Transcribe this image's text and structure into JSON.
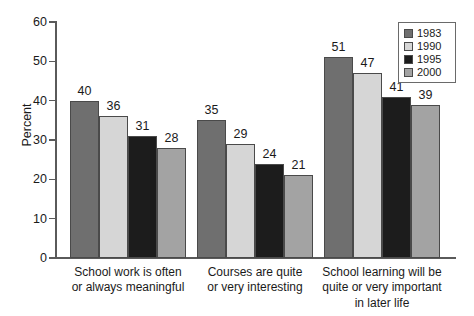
{
  "chart_data": {
    "type": "bar",
    "title": "",
    "xlabel": "",
    "ylabel": "Percent",
    "ylim": [
      0,
      60
    ],
    "ytick_labels": [
      "60",
      "50",
      "40",
      "30",
      "20",
      "10",
      "0"
    ],
    "yticks": [
      60,
      50,
      40,
      30,
      20,
      10,
      0
    ],
    "grid": false,
    "legend_position": "top-right",
    "categories": [
      "School work is often\nor always meaningful",
      "Courses are quite\nor very interesting",
      "School learning will be\nquite or very important\nin later life"
    ],
    "series": [
      {
        "name": "1983",
        "color": "#6f6f6f",
        "values": [
          40,
          35,
          51
        ]
      },
      {
        "name": "1990",
        "color": "#d6d6d6",
        "values": [
          36,
          29,
          47
        ]
      },
      {
        "name": "1995",
        "color": "#1c1c1c",
        "values": [
          31,
          24,
          41
        ]
      },
      {
        "name": "2000",
        "color": "#a3a3a3",
        "values": [
          28,
          21,
          39
        ]
      }
    ]
  },
  "legend": {
    "entries": [
      {
        "label": "1983",
        "color": "#6f6f6f"
      },
      {
        "label": "1990",
        "color": "#d6d6d6"
      },
      {
        "label": "1995",
        "color": "#1c1c1c"
      },
      {
        "label": "2000",
        "color": "#a3a3a3"
      }
    ]
  },
  "axis": {
    "y_title": "Percent",
    "y_ticks": [
      "60",
      "50",
      "40",
      "30",
      "20",
      "10",
      "0"
    ]
  },
  "value_labels": {
    "group1": [
      "40",
      "36",
      "31",
      "28"
    ],
    "group2": [
      "35",
      "29",
      "24",
      "21"
    ],
    "group3": [
      "51",
      "47",
      "41",
      "39"
    ]
  }
}
